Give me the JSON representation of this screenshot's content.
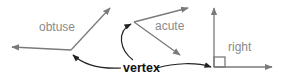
{
  "diagram": {
    "angles": [
      {
        "id": "obtuse",
        "label": "obtuse"
      },
      {
        "id": "acute",
        "label": "acute"
      },
      {
        "id": "right",
        "label": "right"
      }
    ],
    "pointer_label": "vertex",
    "colors": {
      "ray": "#7a7a7a",
      "label": "#8a8a8a",
      "pointer": "#222222",
      "pointer_label": "#111111"
    }
  }
}
